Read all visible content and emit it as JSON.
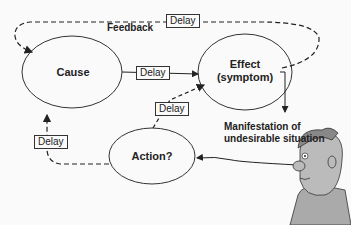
{
  "diagram": {
    "nodes": {
      "cause": {
        "label": "Cause"
      },
      "effect": {
        "label_line1": "Effect",
        "label_line2": "(symptom)"
      },
      "action": {
        "label": "Action?"
      }
    },
    "edges": {
      "cause_to_effect": {
        "delay_label": "Delay",
        "style": "solid"
      },
      "action_to_effect": {
        "delay_label": "Delay",
        "style": "dashed"
      },
      "action_to_cause": {
        "delay_label": "Delay",
        "style": "dashed"
      },
      "effect_to_cause_feedback": {
        "delay_label": "Delay",
        "style": "dashed",
        "label": "Feedback"
      },
      "observer_to_action": {
        "style": "solid"
      },
      "effect_to_manifestation": {
        "style": "solid"
      }
    },
    "annotations": {
      "manifestation_line1": "Manifestation of",
      "manifestation_line2": "undesirable situation"
    },
    "observer": {
      "description": "cartoon man observing"
    }
  }
}
